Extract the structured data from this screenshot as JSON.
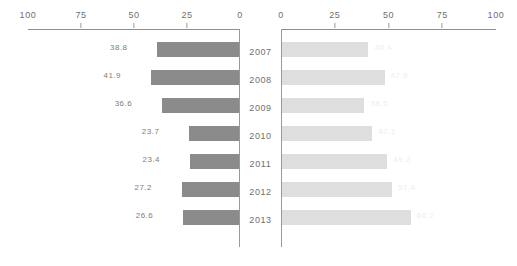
{
  "chart_data": {
    "type": "bar",
    "title": "",
    "subtitle": "",
    "xlabel": "",
    "ylabel": "",
    "layout": "diverging-tornado-two-panel",
    "grid": false,
    "legend": "none",
    "categories": [
      "2007",
      "2008",
      "2009",
      "2010",
      "2011",
      "2012",
      "2013"
    ],
    "axes": {
      "left": {
        "direction": "right-to-left",
        "ticks": [
          100,
          75,
          50,
          25,
          0
        ],
        "tick_labels": [
          "100",
          "75",
          "50",
          "25",
          "0"
        ],
        "xlim": [
          0,
          100
        ]
      },
      "right": {
        "direction": "left-to-right",
        "ticks": [
          0,
          25,
          50,
          75,
          100
        ],
        "tick_labels": [
          "0",
          "25",
          "50",
          "75",
          "100"
        ],
        "xlim": [
          0,
          100
        ]
      }
    },
    "series": [
      {
        "name": "left",
        "color": "#8b8b8b",
        "values": [
          38.8,
          41.9,
          36.6,
          23.7,
          23.4,
          27.2,
          26.6
        ],
        "value_labels": [
          "38.8",
          "41.9",
          "36.6",
          "23.7",
          "23.4",
          "27.2",
          "26.6"
        ]
      },
      {
        "name": "right",
        "color": "#dedede",
        "values": [
          40.4,
          47.9,
          38.5,
          42.1,
          49.2,
          51.4,
          60.2
        ],
        "value_labels": [
          "40.4",
          "47.9",
          "38.5",
          "42.1",
          "49.2",
          "51.4",
          "60.2"
        ]
      }
    ]
  }
}
